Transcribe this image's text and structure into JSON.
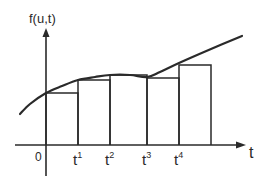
{
  "diagram": {
    "type": "step-approximation-plot",
    "y_axis_label": "f(u,t)",
    "x_axis_label": "t",
    "origin_label": "0",
    "tick_labels": [
      {
        "base": "t",
        "sup": "1",
        "x": 78
      },
      {
        "base": "t",
        "sup": "2",
        "x": 110
      },
      {
        "base": "t",
        "sup": "3",
        "x": 147
      },
      {
        "base": "t",
        "sup": "4",
        "x": 179
      }
    ],
    "line_color": "#2a2a2a",
    "background_color": "#ffffff",
    "axes": {
      "origin": [
        46,
        145
      ],
      "y_axis_top": 28,
      "y_axis_bottom": 176,
      "x_axis_left": 15,
      "x_axis_right": 246
    },
    "curve_points": [
      [
        20,
        114
      ],
      [
        30,
        104
      ],
      [
        46,
        93
      ],
      [
        62,
        86
      ],
      [
        78,
        80
      ],
      [
        95,
        77
      ],
      [
        110,
        75
      ],
      [
        130,
        75
      ],
      [
        147,
        77
      ],
      [
        160,
        72
      ],
      [
        179,
        63
      ],
      [
        211,
        49
      ],
      [
        242,
        36
      ]
    ],
    "steps": [
      {
        "x0": 46,
        "x1": 78,
        "top": 93
      },
      {
        "x0": 78,
        "x1": 110,
        "top": 80
      },
      {
        "x0": 110,
        "x1": 147,
        "top": 75
      },
      {
        "x0": 147,
        "x1": 179,
        "top": 78
      },
      {
        "x0": 179,
        "x1": 211,
        "top": 65
      }
    ]
  }
}
